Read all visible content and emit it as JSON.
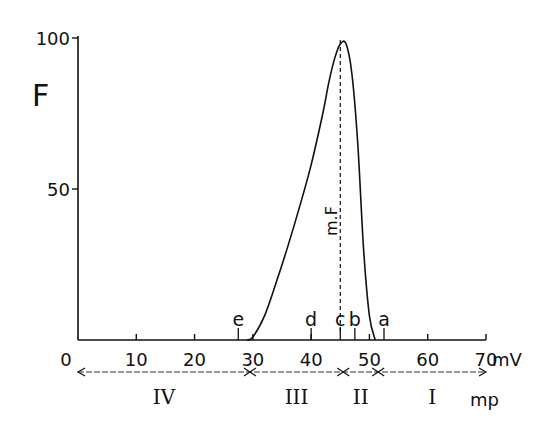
{
  "chart_data": {
    "type": "line",
    "title": "",
    "xlabel": "mV",
    "ylabel": "F",
    "xlim": [
      0,
      70
    ],
    "ylim": [
      0,
      100
    ],
    "x_ticks": [
      "0",
      "10",
      "20",
      "30",
      "40",
      "50",
      "60",
      "70"
    ],
    "y_ticks": [
      "50",
      "100"
    ],
    "x_unit": "mV",
    "grid": false,
    "series": [
      {
        "name": "F",
        "x": [
          29,
          30,
          32,
          34,
          36,
          38,
          40,
          42,
          43,
          44,
          45,
          46,
          47,
          48,
          49,
          50,
          51
        ],
        "values": [
          0,
          1,
          8,
          19,
          31,
          44,
          58,
          75,
          85,
          93,
          98,
          98,
          88,
          65,
          30,
          8,
          0
        ]
      }
    ],
    "annotations": {
      "peak_label": "m.F",
      "peak_x": 45,
      "markers": [
        {
          "label": "e",
          "x": 27.5
        },
        {
          "label": "d",
          "x": 40
        },
        {
          "label": "c",
          "x": 45
        },
        {
          "label": "b",
          "x": 47.5
        },
        {
          "label": "a",
          "x": 52.5
        }
      ],
      "zones": [
        {
          "label": "IV",
          "from": 0,
          "to": 29.5
        },
        {
          "label": "III",
          "from": 29.5,
          "to": 45.5
        },
        {
          "label": "II",
          "from": 45.5,
          "to": 51.5
        },
        {
          "label": "I",
          "from": 51.5,
          "to": 70
        }
      ],
      "zone_unit": "mp"
    }
  }
}
